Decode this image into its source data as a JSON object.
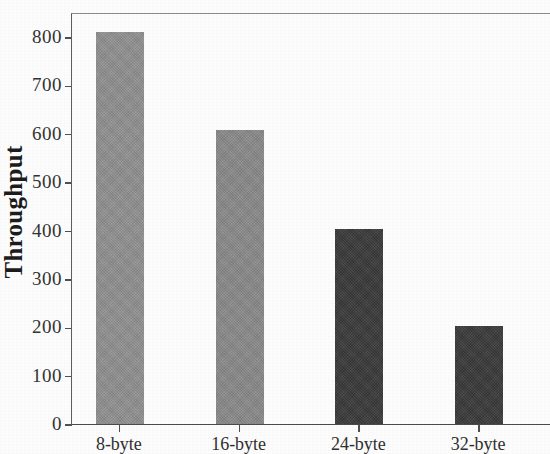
{
  "chart_data": {
    "type": "bar",
    "title": "",
    "subtitle": "",
    "xlabel": "",
    "ylabel": "Throughput",
    "categories": [
      "8-byte",
      "16-byte",
      "24-byte",
      "32-byte"
    ],
    "values": [
      810,
      607,
      404,
      203
    ],
    "ylim": [
      0,
      860
    ],
    "yticks": [
      0,
      100,
      200,
      300,
      400,
      500,
      600,
      700,
      800
    ],
    "ytick_labels": [
      "0",
      "100",
      "200",
      "300",
      "400",
      "500",
      "600",
      "700",
      "800"
    ],
    "grid": false,
    "legend": "none",
    "bar_colors": [
      "#919191",
      "#8a8a8a",
      "#3b3b3b",
      "#3a3a3a"
    ],
    "annotations": []
  },
  "axes": {
    "frame_color": "#4f4f4f",
    "tick_color": "#4f4f4f",
    "label_color": "#2f2f2f",
    "background": "#fcfcfc"
  }
}
